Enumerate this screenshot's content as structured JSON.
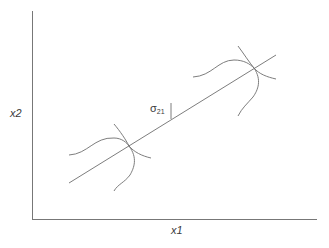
{
  "diagram": {
    "axes": {
      "x_label": "x1",
      "y_label": "x2"
    },
    "annotation": {
      "symbol": "σ",
      "subscript": "21"
    },
    "elements": [
      "regression line",
      "distribution cross at lower point",
      "distribution cross at upper point",
      "vertical tick marking σ21"
    ],
    "colors": {
      "line": "#6e6e6e",
      "text": "#3a3a3a",
      "background": "#ffffff"
    }
  }
}
